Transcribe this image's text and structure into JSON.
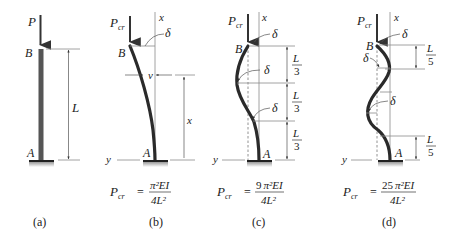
{
  "figure": {
    "panels": [
      {
        "id": "a",
        "caption": "(a)",
        "load_label": "P",
        "top_label": "B",
        "bottom_label": "A",
        "length_label": "L"
      },
      {
        "id": "b",
        "caption": "(b)",
        "load_label": "P",
        "load_sub": "cr",
        "top_label": "B",
        "bottom_label": "A",
        "x_axis": "x",
        "y_axis": "y",
        "deflection": "δ",
        "v_label": "v",
        "x_dim": "x",
        "formula": {
          "lhs": "P",
          "lhs_sub": "cr",
          "eq": "=",
          "num_coef": "",
          "num": "π²EI",
          "den": "4L²"
        }
      },
      {
        "id": "c",
        "caption": "(c)",
        "load_label": "P",
        "load_sub": "cr",
        "top_label": "B",
        "bottom_label": "A",
        "x_axis": "x",
        "y_axis": "y",
        "deflection": "δ",
        "segments": [
          {
            "num": "L",
            "den": "3"
          },
          {
            "num": "L",
            "den": "3"
          },
          {
            "num": "L",
            "den": "3"
          }
        ],
        "formula": {
          "lhs": "P",
          "lhs_sub": "cr",
          "eq": "=",
          "num_coef": "9",
          "num": "π²EI",
          "den": "4L²"
        }
      },
      {
        "id": "d",
        "caption": "(d)",
        "load_label": "P",
        "load_sub": "cr",
        "top_label": "B",
        "bottom_label": "A",
        "x_axis": "x",
        "y_axis": "y",
        "deflection": "δ",
        "segments": [
          {
            "num": "L",
            "den": "5"
          },
          {
            "num": "L",
            "den": "5"
          }
        ],
        "formula": {
          "lhs": "P",
          "lhs_sub": "cr",
          "eq": "=",
          "num_coef": "25",
          "num": "π²EI",
          "den": "4L²"
        }
      }
    ]
  }
}
